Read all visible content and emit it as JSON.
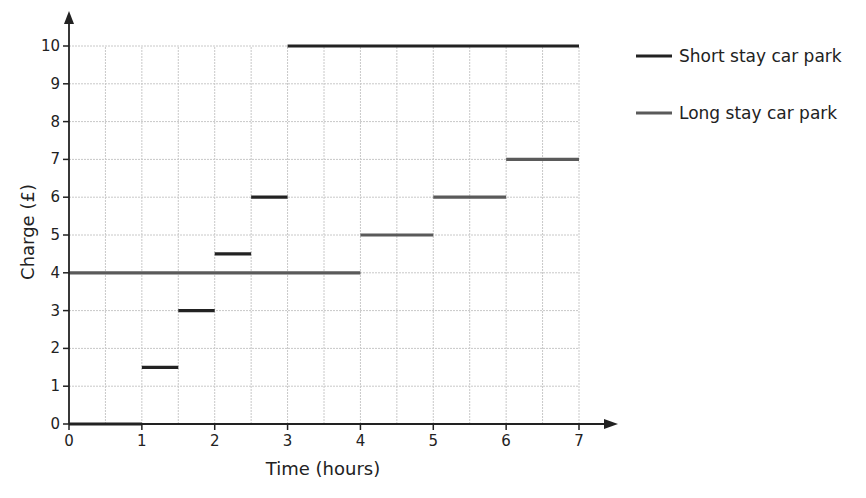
{
  "chart_data": {
    "type": "line",
    "subtype": "step",
    "title": "",
    "xlabel": "Time (hours)",
    "ylabel": "Charge (£)",
    "xlim": [
      0,
      7
    ],
    "ylim": [
      0,
      10
    ],
    "x_ticks": [
      0,
      1,
      2,
      3,
      4,
      5,
      6,
      7
    ],
    "y_ticks": [
      0,
      1,
      2,
      3,
      4,
      5,
      6,
      7,
      8,
      9,
      10
    ],
    "x_grid_step": 0.5,
    "y_grid_step": 1,
    "grid": true,
    "legend_position": "right",
    "series": [
      {
        "name": "Short stay car park",
        "color": "#222222",
        "segments": [
          {
            "x_start": 0,
            "x_end": 1,
            "y": 0
          },
          {
            "x_start": 1,
            "x_end": 1.5,
            "y": 1.5
          },
          {
            "x_start": 1.5,
            "x_end": 2,
            "y": 3
          },
          {
            "x_start": 2,
            "x_end": 2.5,
            "y": 4.5
          },
          {
            "x_start": 2.5,
            "x_end": 3,
            "y": 6
          },
          {
            "x_start": 3,
            "x_end": 7,
            "y": 10
          }
        ]
      },
      {
        "name": "Long stay car park",
        "color": "#5a5a5a",
        "segments": [
          {
            "x_start": 0,
            "x_end": 4,
            "y": 4
          },
          {
            "x_start": 4,
            "x_end": 5,
            "y": 5
          },
          {
            "x_start": 5,
            "x_end": 6,
            "y": 6
          },
          {
            "x_start": 6,
            "x_end": 7,
            "y": 7
          }
        ]
      }
    ]
  }
}
